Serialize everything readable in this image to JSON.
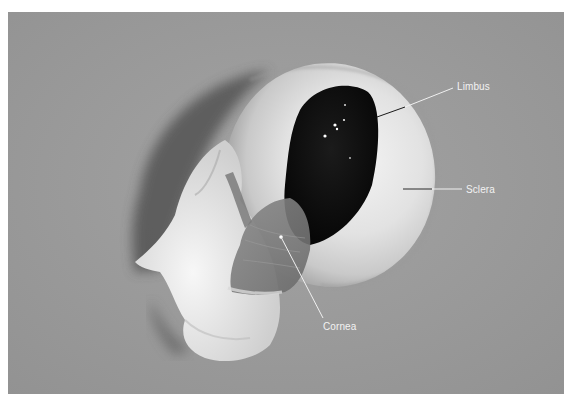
{
  "figure": {
    "type": "photograph",
    "background_color": "#9b9b9b",
    "labels": [
      {
        "id": "limbus",
        "text": "Limbus",
        "x": 457,
        "y": 81
      },
      {
        "id": "sclera",
        "text": "Sclera",
        "x": 466,
        "y": 184
      },
      {
        "id": "cornea",
        "text": "Cornea",
        "x": 323,
        "y": 321
      }
    ]
  }
}
